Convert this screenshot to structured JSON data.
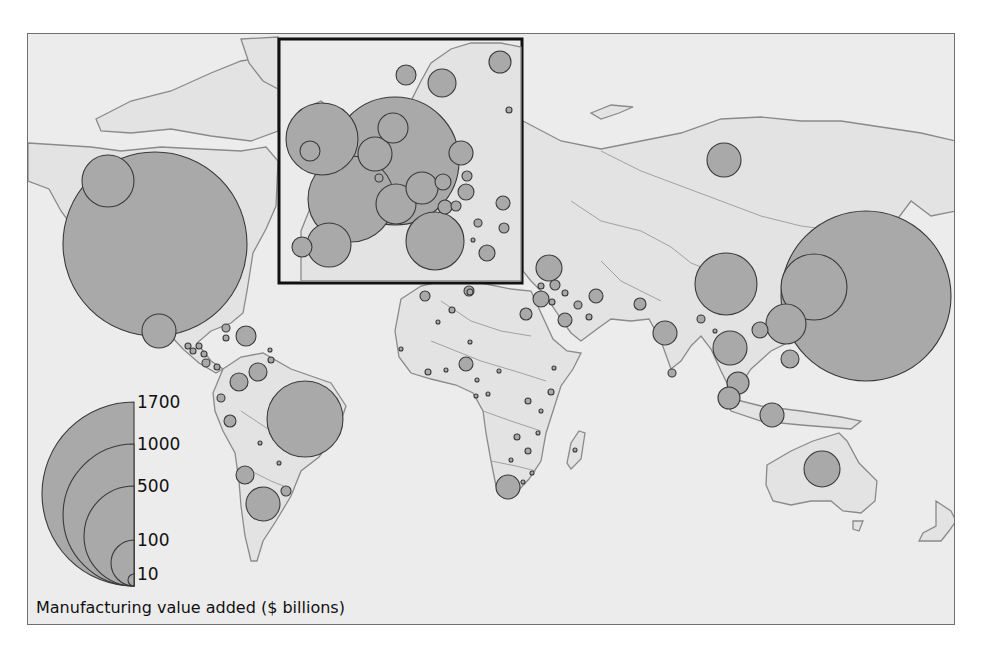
{
  "figure": {
    "title": "Manufacturing value added ($ billions)",
    "colors": {
      "background": "#ececec",
      "land": "#e3e3e3",
      "bubble_fill": "#a9a9a9",
      "bubble_stroke": "#3a3a3a",
      "inset_border": "#111111"
    }
  },
  "legend": {
    "caption": "Manufacturing value added ($ billions)",
    "values": [
      {
        "label": "1700",
        "value": 1700,
        "radius": 92
      },
      {
        "label": "1000",
        "value": 1000,
        "radius": 71
      },
      {
        "label": "500",
        "value": 500,
        "radius": 50
      },
      {
        "label": "100",
        "value": 100,
        "radius": 23
      },
      {
        "label": "10",
        "value": 10,
        "radius": 6
      }
    ]
  },
  "inset": {
    "name": "Europe",
    "x": 277,
    "y": 38,
    "width": 245,
    "height": 245
  },
  "chart_data": {
    "type": "proportional-symbol-map",
    "title": "Manufacturing value added ($ billions)",
    "legend": [
      "1700",
      "1000",
      "500",
      "100",
      "10"
    ],
    "bubbles": [
      {
        "region": "United States",
        "cx": 154,
        "cy": 243,
        "r": 92,
        "approx_value": 1700
      },
      {
        "region": "Canada (west)",
        "cx": 107,
        "cy": 180,
        "r": 26,
        "approx_value": 130
      },
      {
        "region": "Mexico",
        "cx": 158,
        "cy": 330,
        "r": 17,
        "approx_value": 60
      },
      {
        "region": "Cuba/Caribbean",
        "cx": 225,
        "cy": 327,
        "r": 4,
        "approx_value": 4
      },
      {
        "region": "Dominican Rep.",
        "cx": 245,
        "cy": 335,
        "r": 10,
        "approx_value": 20
      },
      {
        "region": "Caribbean small",
        "cx": 225,
        "cy": 337,
        "r": 3,
        "approx_value": 2
      },
      {
        "region": "Guatemala",
        "cx": 187,
        "cy": 345,
        "r": 3,
        "approx_value": 2
      },
      {
        "region": "El Salvador",
        "cx": 192,
        "cy": 350,
        "r": 3,
        "approx_value": 2
      },
      {
        "region": "Honduras",
        "cx": 198,
        "cy": 345,
        "r": 3,
        "approx_value": 2
      },
      {
        "region": "Nicaragua",
        "cx": 203,
        "cy": 353,
        "r": 3,
        "approx_value": 2
      },
      {
        "region": "Costa Rica",
        "cx": 205,
        "cy": 362,
        "r": 4,
        "approx_value": 4
      },
      {
        "region": "Panama",
        "cx": 216,
        "cy": 366,
        "r": 3,
        "approx_value": 2
      },
      {
        "region": "Trinidad",
        "cx": 269,
        "cy": 349,
        "r": 2,
        "approx_value": 1
      },
      {
        "region": "Guyana/Suriname",
        "cx": 270,
        "cy": 359,
        "r": 3,
        "approx_value": 2
      },
      {
        "region": "Venezuela",
        "cx": 257,
        "cy": 371,
        "r": 9,
        "approx_value": 20
      },
      {
        "region": "Colombia",
        "cx": 238,
        "cy": 381,
        "r": 9,
        "approx_value": 20
      },
      {
        "region": "Ecuador",
        "cx": 220,
        "cy": 397,
        "r": 4,
        "approx_value": 4
      },
      {
        "region": "Peru",
        "cx": 229,
        "cy": 420,
        "r": 6,
        "approx_value": 10
      },
      {
        "region": "Brazil",
        "cx": 304,
        "cy": 418,
        "r": 38,
        "approx_value": 300
      },
      {
        "region": "Bolivia",
        "cx": 259,
        "cy": 442,
        "r": 2,
        "approx_value": 1
      },
      {
        "region": "Paraguay",
        "cx": 278,
        "cy": 462,
        "r": 2,
        "approx_value": 1
      },
      {
        "region": "Chile",
        "cx": 244,
        "cy": 474,
        "r": 9,
        "approx_value": 20
      },
      {
        "region": "Argentina",
        "cx": 262,
        "cy": 503,
        "r": 17,
        "approx_value": 60
      },
      {
        "region": "Uruguay",
        "cx": 285,
        "cy": 490,
        "r": 5,
        "approx_value": 6
      },
      {
        "region": "United Kingdom",
        "cx": 321,
        "cy": 138,
        "r": 36,
        "approx_value": 280
      },
      {
        "region": "Ireland",
        "cx": 309,
        "cy": 150,
        "r": 10,
        "approx_value": 25
      },
      {
        "region": "Germany",
        "cx": 394,
        "cy": 160,
        "r": 64,
        "approx_value": 850
      },
      {
        "region": "France",
        "cx": 350,
        "cy": 198,
        "r": 43,
        "approx_value": 380
      },
      {
        "region": "Spain",
        "cx": 328,
        "cy": 244,
        "r": 22,
        "approx_value": 100
      },
      {
        "region": "Portugal",
        "cx": 301,
        "cy": 246,
        "r": 10,
        "approx_value": 25
      },
      {
        "region": "Italy",
        "cx": 434,
        "cy": 240,
        "r": 29,
        "approx_value": 180
      },
      {
        "region": "Netherlands",
        "cx": 392,
        "cy": 127,
        "r": 15,
        "approx_value": 50
      },
      {
        "region": "Belgium",
        "cx": 374,
        "cy": 153,
        "r": 17,
        "approx_value": 60
      },
      {
        "region": "Luxembourg",
        "cx": 378,
        "cy": 177,
        "r": 4,
        "approx_value": 4
      },
      {
        "region": "Switzerland",
        "cx": 395,
        "cy": 203,
        "r": 20,
        "approx_value": 80
      },
      {
        "region": "Austria",
        "cx": 421,
        "cy": 187,
        "r": 16,
        "approx_value": 55
      },
      {
        "region": "Czech Rep.",
        "cx": 442,
        "cy": 181,
        "r": 8,
        "approx_value": 15
      },
      {
        "region": "Poland",
        "cx": 460,
        "cy": 152,
        "r": 12,
        "approx_value": 35
      },
      {
        "region": "Hungary",
        "cx": 465,
        "cy": 191,
        "r": 8,
        "approx_value": 15
      },
      {
        "region": "Slovenia",
        "cx": 444,
        "cy": 206,
        "r": 7,
        "approx_value": 10
      },
      {
        "region": "Croatia",
        "cx": 455,
        "cy": 205,
        "r": 5,
        "approx_value": 6
      },
      {
        "region": "Slovakia",
        "cx": 466,
        "cy": 175,
        "r": 5,
        "approx_value": 6
      },
      {
        "region": "Denmark",
        "cx": 405,
        "cy": 74,
        "r": 10,
        "approx_value": 25
      },
      {
        "region": "Sweden",
        "cx": 441,
        "cy": 82,
        "r": 14,
        "approx_value": 45
      },
      {
        "region": "Finland",
        "cx": 499,
        "cy": 61,
        "r": 11,
        "approx_value": 30
      },
      {
        "region": "Lithuania",
        "cx": 508,
        "cy": 109,
        "r": 3,
        "approx_value": 2
      },
      {
        "region": "Romania",
        "cx": 502,
        "cy": 202,
        "r": 7,
        "approx_value": 10
      },
      {
        "region": "Serbia",
        "cx": 477,
        "cy": 222,
        "r": 4,
        "approx_value": 4
      },
      {
        "region": "Bulgaria",
        "cx": 503,
        "cy": 227,
        "r": 5,
        "approx_value": 6
      },
      {
        "region": "Macedonia",
        "cx": 472,
        "cy": 239,
        "r": 2,
        "approx_value": 1
      },
      {
        "region": "Greece",
        "cx": 486,
        "cy": 252,
        "r": 8,
        "approx_value": 15
      },
      {
        "region": "Russia",
        "cx": 723,
        "cy": 159,
        "r": 17,
        "approx_value": 60
      },
      {
        "region": "Turkey",
        "cx": 548,
        "cy": 267,
        "r": 13,
        "approx_value": 40
      },
      {
        "region": "Cyprus",
        "cx": 540,
        "cy": 285,
        "r": 3,
        "approx_value": 2
      },
      {
        "region": "Syria",
        "cx": 554,
        "cy": 284,
        "r": 5,
        "approx_value": 6
      },
      {
        "region": "Israel",
        "cx": 540,
        "cy": 298,
        "r": 8,
        "approx_value": 15
      },
      {
        "region": "Jordan",
        "cx": 551,
        "cy": 301,
        "r": 3,
        "approx_value": 2
      },
      {
        "region": "Iraq",
        "cx": 564,
        "cy": 292,
        "r": 3,
        "approx_value": 2
      },
      {
        "region": "Iran",
        "cx": 595,
        "cy": 295,
        "r": 7,
        "approx_value": 10
      },
      {
        "region": "Kuwait",
        "cx": 577,
        "cy": 304,
        "r": 4,
        "approx_value": 4
      },
      {
        "region": "Saudi Arabia",
        "cx": 564,
        "cy": 319,
        "r": 7,
        "approx_value": 10
      },
      {
        "region": "UAE",
        "cx": 588,
        "cy": 316,
        "r": 3,
        "approx_value": 2
      },
      {
        "region": "Egypt",
        "cx": 525,
        "cy": 313,
        "r": 6,
        "approx_value": 8
      },
      {
        "region": "Pakistan",
        "cx": 639,
        "cy": 303,
        "r": 6,
        "approx_value": 8
      },
      {
        "region": "India",
        "cx": 664,
        "cy": 332,
        "r": 12,
        "approx_value": 35
      },
      {
        "region": "Sri Lanka",
        "cx": 671,
        "cy": 372,
        "r": 4,
        "approx_value": 4
      },
      {
        "region": "Morocco",
        "cx": 424,
        "cy": 295,
        "r": 5,
        "approx_value": 6
      },
      {
        "region": "Algeria",
        "cx": 468,
        "cy": 290,
        "r": 5,
        "approx_value": 6
      },
      {
        "region": "Tunisia",
        "cx": 469,
        "cy": 291,
        "r": 3,
        "approx_value": 2
      },
      {
        "region": "Libya",
        "cx": 451,
        "cy": 309,
        "r": 3,
        "approx_value": 2
      },
      {
        "region": "Senegal",
        "cx": 400,
        "cy": 348,
        "r": 2,
        "approx_value": 1
      },
      {
        "region": "Mali",
        "cx": 437,
        "cy": 321,
        "r": 2,
        "approx_value": 1
      },
      {
        "region": "Niger",
        "cx": 469,
        "cy": 341,
        "r": 2,
        "approx_value": 1
      },
      {
        "region": "Ivory Coast",
        "cx": 427,
        "cy": 371,
        "r": 3,
        "approx_value": 2
      },
      {
        "region": "Ghana",
        "cx": 445,
        "cy": 369,
        "r": 2,
        "approx_value": 1
      },
      {
        "region": "Nigeria",
        "cx": 465,
        "cy": 363,
        "r": 7,
        "approx_value": 10
      },
      {
        "region": "Cameroon",
        "cx": 476,
        "cy": 379,
        "r": 2,
        "approx_value": 1
      },
      {
        "region": "Chad",
        "cx": 498,
        "cy": 370,
        "r": 2,
        "approx_value": 1
      },
      {
        "region": "Gabon",
        "cx": 475,
        "cy": 395,
        "r": 2,
        "approx_value": 1
      },
      {
        "region": "Congo",
        "cx": 487,
        "cy": 393,
        "r": 2,
        "approx_value": 1
      },
      {
        "region": "Ethiopia",
        "cx": 553,
        "cy": 367,
        "r": 2,
        "approx_value": 1
      },
      {
        "region": "Uganda",
        "cx": 527,
        "cy": 400,
        "r": 3,
        "approx_value": 2
      },
      {
        "region": "Kenya",
        "cx": 550,
        "cy": 391,
        "r": 3,
        "approx_value": 2
      },
      {
        "region": "Tanzania",
        "cx": 540,
        "cy": 410,
        "r": 2,
        "approx_value": 1
      },
      {
        "region": "Zambia",
        "cx": 516,
        "cy": 436,
        "r": 3,
        "approx_value": 2
      },
      {
        "region": "Malawi",
        "cx": 537,
        "cy": 432,
        "r": 2,
        "approx_value": 1
      },
      {
        "region": "Zimbabwe",
        "cx": 527,
        "cy": 450,
        "r": 3,
        "approx_value": 2
      },
      {
        "region": "Botswana",
        "cx": 510,
        "cy": 459,
        "r": 2,
        "approx_value": 1
      },
      {
        "region": "Mozambique",
        "cx": 531,
        "cy": 472,
        "r": 2,
        "approx_value": 1
      },
      {
        "region": "South Africa",
        "cx": 507,
        "cy": 486,
        "r": 12,
        "approx_value": 35
      },
      {
        "region": "Swaziland",
        "cx": 522,
        "cy": 481,
        "r": 2,
        "approx_value": 1
      },
      {
        "region": "Madagascar",
        "cx": 574,
        "cy": 449,
        "r": 2,
        "approx_value": 1
      },
      {
        "region": "China",
        "cx": 725,
        "cy": 283,
        "r": 31,
        "approx_value": 200
      },
      {
        "region": "Japan",
        "cx": 865,
        "cy": 295,
        "r": 85,
        "approx_value": 1450
      },
      {
        "region": "South Korea",
        "cx": 813,
        "cy": 286,
        "r": 33,
        "approx_value": 230
      },
      {
        "region": "Taiwan",
        "cx": 785,
        "cy": 323,
        "r": 20,
        "approx_value": 80
      },
      {
        "region": "Philippines",
        "cx": 789,
        "cy": 358,
        "r": 9,
        "approx_value": 20
      },
      {
        "region": "Vietnam",
        "cx": 759,
        "cy": 329,
        "r": 8,
        "approx_value": 15
      },
      {
        "region": "Bangladesh",
        "cx": 700,
        "cy": 318,
        "r": 4,
        "approx_value": 4
      },
      {
        "region": "Burma",
        "cx": 714,
        "cy": 330,
        "r": 2,
        "approx_value": 1
      },
      {
        "region": "Thailand",
        "cx": 729,
        "cy": 347,
        "r": 17,
        "approx_value": 60
      },
      {
        "region": "Malaysia",
        "cx": 737,
        "cy": 382,
        "r": 11,
        "approx_value": 30
      },
      {
        "region": "Singapore",
        "cx": 728,
        "cy": 397,
        "r": 11,
        "approx_value": 30
      },
      {
        "region": "Indonesia",
        "cx": 771,
        "cy": 414,
        "r": 12,
        "approx_value": 35
      },
      {
        "region": "Australia",
        "cx": 821,
        "cy": 468,
        "r": 18,
        "approx_value": 65
      },
      {
        "region": "New Zealand",
        "cx": 963,
        "cy": 523,
        "r": 8,
        "approx_value": 15
      }
    ]
  }
}
